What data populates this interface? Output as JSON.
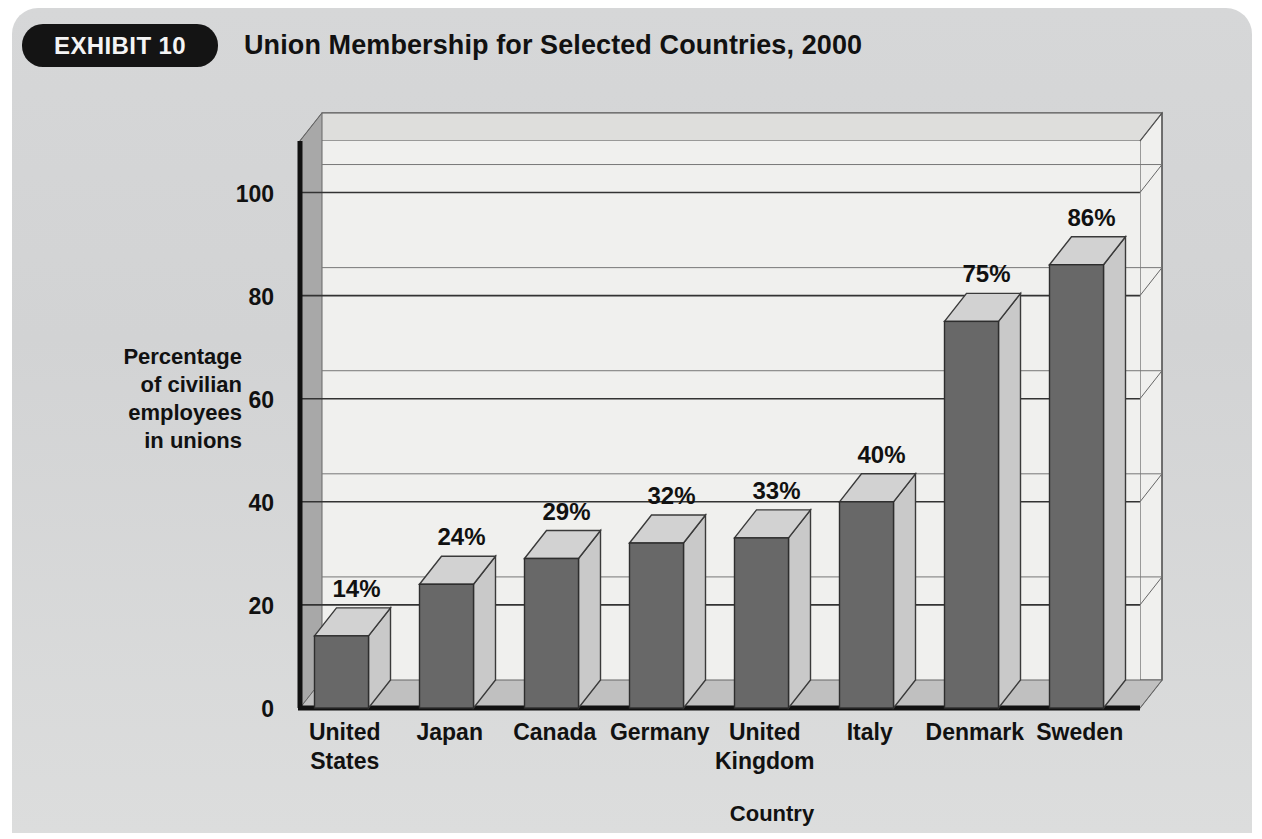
{
  "header": {
    "badge_label": "EXHIBIT 10",
    "title": "Union Membership for Selected Countries, 2000"
  },
  "colors": {
    "card_background": "#d4d5d6",
    "badge_background": "#141414",
    "badge_text": "#f4f4f4",
    "plot_background": "#f0f0ee",
    "plot_left_wall": "#a8a8a8",
    "plot_floor": "#c0c0c0",
    "bar_front": "#686868",
    "bar_side": "#c9c9c9",
    "bar_top": "#d2d2d2",
    "axis_line": "#111111",
    "gridline": "#333333",
    "text": "#111111"
  },
  "chart_data": {
    "type": "bar",
    "title": "Union Membership for Selected Countries, 2000",
    "subtitle": "",
    "xlabel": "Country",
    "ylabel": "Percentage of civilian employees in unions",
    "ylabel_lines": [
      "Percentage",
      "of civilian",
      "employees",
      "in unions"
    ],
    "categories": [
      "United States",
      "Japan",
      "Canada",
      "Germany",
      "United Kingdom",
      "Italy",
      "Denmark",
      "Sweden"
    ],
    "category_lines": [
      [
        "United",
        "States"
      ],
      [
        "Japan"
      ],
      [
        "Canada"
      ],
      [
        "Germany"
      ],
      [
        "United",
        "Kingdom"
      ],
      [
        "Italy"
      ],
      [
        "Denmark"
      ],
      [
        "Sweden"
      ]
    ],
    "values": [
      14,
      24,
      29,
      32,
      33,
      40,
      75,
      86
    ],
    "value_labels": [
      "14%",
      "24%",
      "29%",
      "32%",
      "33%",
      "40%",
      "75%",
      "86%"
    ],
    "ylim": [
      0,
      110
    ],
    "yticks": [
      0,
      20,
      40,
      60,
      80,
      100
    ],
    "ytick_labels": [
      "0",
      "20",
      "40",
      "60",
      "80",
      "100"
    ],
    "grid": true,
    "grid_axis": "y",
    "legend": false,
    "legend_position": "none",
    "three_d": true,
    "units": "percent"
  }
}
